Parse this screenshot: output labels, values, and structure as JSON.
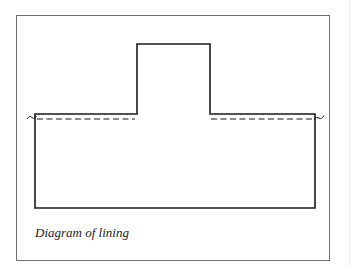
{
  "figure": {
    "caption": "Diagram of lining",
    "elements": [
      {
        "name": "lining-outline",
        "kind": "solid outline",
        "description": "Rectangular body with a raised central tab"
      },
      {
        "name": "fold-line-left",
        "kind": "dashed line"
      },
      {
        "name": "fold-line-right",
        "kind": "dashed line"
      },
      {
        "name": "tilde-mark-left",
        "kind": "tilde mark"
      },
      {
        "name": "tilde-mark-right",
        "kind": "tilde mark"
      }
    ],
    "colors": {
      "line": "#1a1a1a",
      "frame": "#6e6e6e",
      "background": "#ffffff"
    }
  }
}
